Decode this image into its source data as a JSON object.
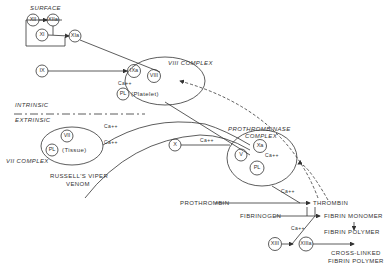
{
  "diagram": {
    "title_regions": {
      "surface": "SURFACE",
      "intrinsic": "INTRINSIC",
      "extrinsic": "EXTRINSIC"
    },
    "complexes": {
      "viii_complex": "VIII COMPLEX",
      "vii_complex": "VII COMPLEX",
      "prothrombinase_line1": "PROTHROMBINASE",
      "prothrombinase_line2": "COMPLEX"
    },
    "factors": {
      "xii": "XII",
      "xiia": "XIIa",
      "xi": "XI",
      "xia": "XIa",
      "ix": "IX",
      "ixa": "IXa",
      "viii": "VIII",
      "pl": "PL",
      "platelet": "(Platelet)",
      "vii": "VII",
      "tissue": "(Tissue)",
      "x": "X",
      "xa": "Xa",
      "v": "V",
      "xiii": "XIII",
      "xiiia": "XIIIa"
    },
    "cofactor": "Ca++",
    "labels": {
      "russells_line1": "RUSSELL'S VIPER",
      "russells_line2": "VENOM",
      "prothrombin": "PROTHROMBIN",
      "thrombin": "THROMBIN",
      "fibrinogen": "FIBRINOGEN",
      "fibrin_monomer_a": "FIBRIN",
      "fibrin_monomer_b": "MONOMER",
      "fibrin_polymer_a": "FIBRIN",
      "fibrin_polymer_b": "POLYMER",
      "crosslinked_line1": "CROSS-LINKED",
      "crosslinked_line2": "FIBRIN  POLYMER"
    }
  }
}
